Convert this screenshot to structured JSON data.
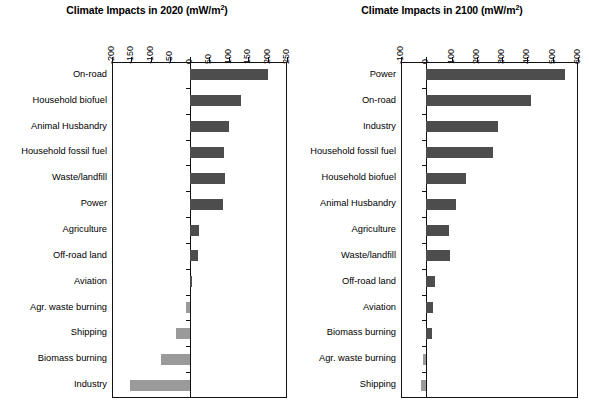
{
  "figure": {
    "background": "#ffffff",
    "bar_positive_color": "#4d4d4d",
    "bar_negative_color": "#9a9a9a",
    "axis_color": "#111111"
  },
  "panels": [
    {
      "id": "panel-2020",
      "title_main": "Climate Impacts in 2020 (mW/m",
      "title_sup": "2",
      "title_tail": ")",
      "title_full": "Climate Impacts in 2020 (mW/m2)"
    },
    {
      "id": "panel-2100",
      "title_main": "Climate Impacts in 2100 (mW/m",
      "title_sup": "2",
      "title_tail": ")",
      "title_full": "Climate Impacts in 2100 (mW/m2)"
    }
  ],
  "chart_data": [
    {
      "type": "bar",
      "orientation": "horizontal",
      "title": "Climate Impacts in 2020 (mW/m2)",
      "xlabel": "",
      "ylabel": "",
      "xlim": [
        -200,
        250
      ],
      "xticks": [
        -200,
        -150,
        -100,
        -50,
        0,
        50,
        100,
        150,
        200,
        250
      ],
      "xtick_labels": [
        "-200",
        "-150",
        "-100",
        "-50",
        "0",
        "50",
        "100",
        "150",
        "200",
        "250"
      ],
      "grid": false,
      "legend": "none",
      "categories": [
        "On-road",
        "Household biofuel",
        "Animal Husbandry",
        "Household fossil fuel",
        "Waste/landfill",
        "Power",
        "Agriculture",
        "Off-road land",
        "Aviation",
        "Agr. waste burning",
        "Shipping",
        "Biomass burning",
        "Industry"
      ],
      "values": [
        200,
        130,
        100,
        88,
        90,
        85,
        22,
        20,
        5,
        -10,
        -35,
        -75,
        -155
      ]
    },
    {
      "type": "bar",
      "orientation": "horizontal",
      "title": "Climate Impacts in 2100 (mW/m2)",
      "xlabel": "",
      "ylabel": "",
      "xlim": [
        -100,
        600
      ],
      "xticks": [
        -100,
        0,
        100,
        200,
        300,
        400,
        500,
        600
      ],
      "xtick_labels": [
        "-100",
        "0",
        "100",
        "200",
        "300",
        "400",
        "500",
        "600"
      ],
      "grid": false,
      "legend": "none",
      "categories": [
        "Power",
        "On-road",
        "Industry",
        "Household fossil fuel",
        "Household biofuel",
        "Animal Husbandry",
        "Agriculture",
        "Waste/landfill",
        "Off-road land",
        "Aviation",
        "Biomass burning",
        "Agr. waste burning",
        "Shipping"
      ],
      "values": [
        550,
        415,
        285,
        265,
        160,
        120,
        90,
        95,
        35,
        27,
        25,
        -12,
        -20
      ]
    }
  ]
}
